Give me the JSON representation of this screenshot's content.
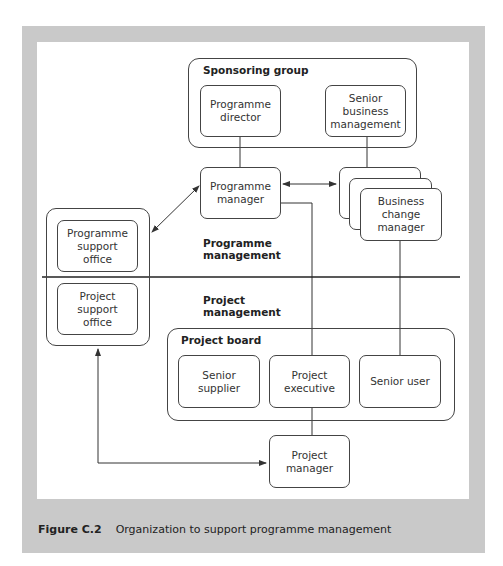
{
  "figure": {
    "caption_label": "Figure C.2",
    "caption_text": "Organization to support programme management"
  },
  "groups": {
    "sponsoring_group": "Sponsoring group",
    "project_board": "Project board"
  },
  "sections": {
    "programme_management": "Programme management",
    "project_management": "Project management"
  },
  "nodes": {
    "programme_director": "Programme director",
    "senior_business_management": "Senior business management",
    "programme_manager": "Programme manager",
    "business_change_manager": "Business change manager",
    "programme_support_office": "Programme support office",
    "project_support_office": "Project support office",
    "senior_supplier": "Senior supplier",
    "project_executive": "Project executive",
    "senior_user": "Senior user",
    "project_manager": "Project manager"
  },
  "colors": {
    "frame": "#c9c9c9",
    "line": "#333333"
  }
}
